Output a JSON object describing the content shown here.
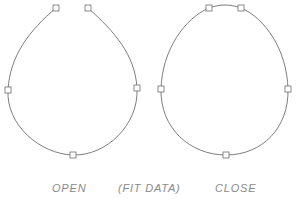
{
  "diagram": {
    "stroke_color": "#6e6e6e",
    "text_color": "#8a8a8a",
    "open_spline": {
      "label": "OPEN",
      "closed": false,
      "fit_points": [
        [
          56,
          8
        ],
        [
          8,
          90
        ],
        [
          73,
          155
        ],
        [
          137,
          88
        ],
        [
          88,
          8
        ]
      ]
    },
    "closed_spline": {
      "label": "CLOSE",
      "closed": true,
      "fit_points": [
        [
          209,
          8
        ],
        [
          161,
          89
        ],
        [
          226,
          155
        ],
        [
          288,
          89
        ],
        [
          241,
          8
        ]
      ]
    },
    "center_label": "(FIT DATA)"
  }
}
